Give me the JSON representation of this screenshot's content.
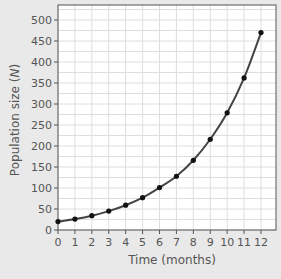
{
  "chart_data": {
    "type": "line",
    "title": "",
    "xlabel": "Time (months)",
    "ylabel": "Population size (N)",
    "x": [
      0,
      1,
      2,
      3,
      4,
      5,
      6,
      7,
      8,
      9,
      10,
      11,
      12
    ],
    "series": [
      {
        "name": "Population size",
        "values": [
          20,
          26,
          34,
          45,
          59,
          77,
          101,
          128,
          166,
          216,
          279,
          362,
          470
        ],
        "markers": true,
        "smooth": true
      }
    ],
    "xlim": [
      0,
      12.9
    ],
    "ylim": [
      0,
      530
    ],
    "xticks": [
      0,
      1,
      2,
      3,
      4,
      5,
      6,
      7,
      8,
      9,
      10,
      11,
      12
    ],
    "yticks": [
      0,
      50,
      100,
      150,
      200,
      250,
      300,
      350,
      400,
      450,
      500
    ],
    "grid": true,
    "legend": null
  },
  "colors": {
    "background": "#e9e9e9",
    "plot_bg": "#ffffff",
    "grid": "#dedede",
    "axis": "#555555",
    "line": "#444444",
    "marker": "#111111"
  }
}
